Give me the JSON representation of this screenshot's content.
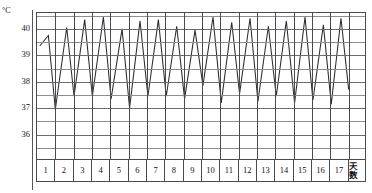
{
  "chart_data": {
    "type": "line",
    "title": "",
    "subtitle": "",
    "ylabel": "°C",
    "xlabel": "天数",
    "unit_symbol": "°C",
    "xaxis_caption": "天数",
    "ylim": [
      35.0,
      40.6
    ],
    "xlim": [
      0,
      17
    ],
    "grid": true,
    "legend": null,
    "legend_position": "none",
    "y_major_ticks": [
      40,
      39,
      38,
      37,
      36
    ],
    "y_tick_labels": [
      "40",
      "39",
      "38",
      "37",
      "36"
    ],
    "y_minor_step": 0.5,
    "categories": [
      "1",
      "2",
      "3",
      "4",
      "5",
      "6",
      "7",
      "8",
      "9",
      "10",
      "11",
      "12",
      "13",
      "14",
      "15",
      "16",
      "17"
    ],
    "series": [
      {
        "name": "体温",
        "comment": "sawtooth fever curve: daily peak then trough",
        "points": [
          {
            "x": 0.15,
            "y": 39.35
          },
          {
            "x": 0.62,
            "y": 39.75
          },
          {
            "x": 1.0,
            "y": 36.95
          },
          {
            "x": 1.62,
            "y": 40.05
          },
          {
            "x": 2.02,
            "y": 37.45
          },
          {
            "x": 2.6,
            "y": 40.35
          },
          {
            "x": 3.02,
            "y": 37.45
          },
          {
            "x": 3.62,
            "y": 40.45
          },
          {
            "x": 4.04,
            "y": 37.35
          },
          {
            "x": 4.64,
            "y": 40.0
          },
          {
            "x": 5.05,
            "y": 37.0
          },
          {
            "x": 5.62,
            "y": 40.3
          },
          {
            "x": 6.05,
            "y": 37.45
          },
          {
            "x": 6.62,
            "y": 40.35
          },
          {
            "x": 7.05,
            "y": 37.45
          },
          {
            "x": 7.62,
            "y": 40.1
          },
          {
            "x": 8.05,
            "y": 37.35
          },
          {
            "x": 8.62,
            "y": 39.95
          },
          {
            "x": 9.05,
            "y": 37.85
          },
          {
            "x": 9.6,
            "y": 40.45
          },
          {
            "x": 10.05,
            "y": 37.2
          },
          {
            "x": 10.62,
            "y": 40.25
          },
          {
            "x": 11.05,
            "y": 37.55
          },
          {
            "x": 11.62,
            "y": 40.4
          },
          {
            "x": 12.05,
            "y": 37.25
          },
          {
            "x": 12.62,
            "y": 40.1
          },
          {
            "x": 13.05,
            "y": 37.45
          },
          {
            "x": 13.6,
            "y": 40.3
          },
          {
            "x": 14.05,
            "y": 37.2
          },
          {
            "x": 14.62,
            "y": 40.45
          },
          {
            "x": 15.05,
            "y": 37.3
          },
          {
            "x": 15.62,
            "y": 40.15
          },
          {
            "x": 16.05,
            "y": 37.15
          },
          {
            "x": 16.58,
            "y": 40.4
          },
          {
            "x": 17.0,
            "y": 37.7
          }
        ]
      }
    ]
  }
}
